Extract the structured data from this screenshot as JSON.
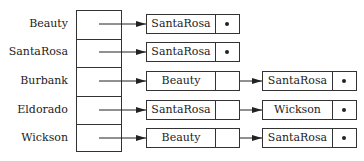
{
  "diagram": {
    "type": "hash-table-chaining",
    "buckets": [
      {
        "key": "Beauty",
        "chain": [
          "SantaRosa"
        ]
      },
      {
        "key": "SantaRosa",
        "chain": [
          "SantaRosa"
        ]
      },
      {
        "key": "Burbank",
        "chain": [
          "Beauty",
          "SantaRosa"
        ]
      },
      {
        "key": "Eldorado",
        "chain": [
          "SantaRosa",
          "Wickson"
        ]
      },
      {
        "key": "Wickson",
        "chain": [
          "Beauty",
          "SantaRosa"
        ]
      }
    ],
    "null_marker": "•",
    "colors": {
      "line": "#333333",
      "text": "#222222",
      "background": "#ffffff"
    }
  }
}
